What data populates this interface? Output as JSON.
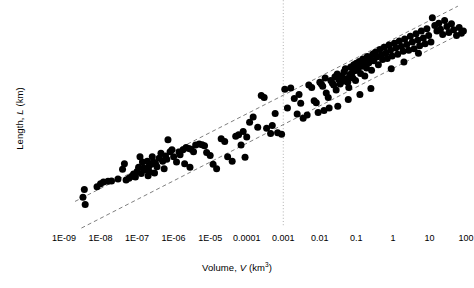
{
  "chart_data": {
    "type": "scatter",
    "title": "",
    "xlabel": "Volume, V (km3)",
    "ylabel": "Length, L (km)",
    "xscale": "log",
    "yscale": "log",
    "xlim": [
      1e-09,
      100
    ],
    "ylim": [
      0.001,
      100
    ],
    "grid": false,
    "legend": null,
    "xticks": [
      {
        "value": 1e-09,
        "label": "1E-09"
      },
      {
        "value": 1e-08,
        "label": "1E-08"
      },
      {
        "value": 1e-07,
        "label": "1E-07"
      },
      {
        "value": 1e-06,
        "label": "1E-06"
      },
      {
        "value": 1e-05,
        "label": "1E-05"
      },
      {
        "value": 0.0001,
        "label": "0.0001"
      },
      {
        "value": 0.001,
        "label": "0.001"
      },
      {
        "value": 0.01,
        "label": "0.01"
      },
      {
        "value": 0.1,
        "label": "0.1"
      },
      {
        "value": 1,
        "label": "1"
      },
      {
        "value": 10,
        "label": "10"
      },
      {
        "value": 100,
        "label": "100"
      }
    ],
    "yticks": [
      {
        "value": 100,
        "label": "100"
      },
      {
        "value": 10,
        "label": "10"
      },
      {
        "value": 1,
        "label": "1"
      },
      {
        "value": 0.1,
        "label": "0.1"
      },
      {
        "value": 0.01,
        "label": "0.01"
      },
      {
        "value": 0.001,
        "label": "0.001"
      }
    ],
    "annotations": [
      {
        "name": "upper-bound-line",
        "type": "dashed-line",
        "style": "dashed",
        "color": "#808080",
        "points": [
          [
            2e-09,
            0.0042
          ],
          [
            60,
            110
          ]
        ]
      },
      {
        "name": "lower-bound-line",
        "type": "dashed-line",
        "style": "dashed",
        "color": "#808080",
        "points": [
          [
            3e-09,
            0.00105
          ],
          [
            70,
            26
          ]
        ]
      },
      {
        "name": "volume-threshold-line",
        "type": "vertical-dotted-line",
        "style": "dotted",
        "color": "#b0b0b0",
        "x": 0.001,
        "ytop": 150,
        "ybottom": 0.00115
      }
    ],
    "marker": {
      "shape": "circle",
      "color": "#000000",
      "size_px": 7
    },
    "points": [
      [
        3.3e-09,
        0.0052
      ],
      [
        3.6e-09,
        0.0078
      ],
      [
        1.2e-08,
        0.0115
      ],
      [
        1.6e-08,
        0.012
      ],
      [
        2e-08,
        0.0122
      ],
      [
        3e-08,
        0.0135
      ],
      [
        4e-08,
        0.0225
      ],
      [
        4.5e-08,
        0.03
      ],
      [
        6e-08,
        0.014
      ],
      [
        7e-08,
        0.0155
      ],
      [
        8e-08,
        0.0175
      ],
      [
        9e-08,
        0.015
      ],
      [
        1e-07,
        0.02
      ],
      [
        1.1e-07,
        0.025
      ],
      [
        1.2e-07,
        0.043
      ],
      [
        1.4e-07,
        0.033
      ],
      [
        1.5e-07,
        0.024
      ],
      [
        1.7e-07,
        0.0215
      ],
      [
        2e-07,
        0.016
      ],
      [
        2.1e-07,
        0.026
      ],
      [
        2.4e-07,
        0.029
      ],
      [
        2.6e-07,
        0.043
      ],
      [
        2.8e-07,
        0.033
      ],
      [
        3e-07,
        0.0185
      ],
      [
        3.5e-07,
        0.0255
      ],
      [
        4e-07,
        0.04
      ],
      [
        4.5e-07,
        0.052
      ],
      [
        5e-07,
        0.034
      ],
      [
        5.5e-07,
        0.023
      ],
      [
        6e-07,
        0.045
      ],
      [
        7e-07,
        0.105
      ],
      [
        8e-07,
        0.056
      ],
      [
        9e-07,
        0.062
      ],
      [
        1e-06,
        0.043
      ],
      [
        1.2e-06,
        0.033
      ],
      [
        1.5e-06,
        0.048
      ],
      [
        1.8e-06,
        0.062
      ],
      [
        2.2e-06,
        0.07
      ],
      [
        2.6e-06,
        0.066
      ],
      [
        3e-06,
        0.064
      ],
      [
        3.5e-06,
        0.056
      ],
      [
        4e-06,
        0.079
      ],
      [
        5e-06,
        0.084
      ],
      [
        6e-06,
        0.081
      ],
      [
        7e-06,
        0.076
      ],
      [
        8e-06,
        0.054
      ],
      [
        1e-05,
        0.046
      ],
      [
        1.2e-05,
        0.029
      ],
      [
        1.5e-05,
        0.023
      ],
      [
        2e-05,
        0.11
      ],
      [
        2.5e-05,
        0.095
      ],
      [
        3e-05,
        0.043
      ],
      [
        4e-05,
        0.034
      ],
      [
        5e-05,
        0.125
      ],
      [
        6e-05,
        0.135
      ],
      [
        7e-05,
        0.08
      ],
      [
        9e-05,
        0.042
      ],
      [
        0.00012,
        0.26
      ],
      [
        0.00015,
        0.34
      ],
      [
        0.0002,
        0.2
      ],
      [
        0.00025,
        1.05
      ],
      [
        0.0003,
        0.95
      ],
      [
        0.00035,
        0.19
      ],
      [
        0.00045,
        0.145
      ],
      [
        0.0006,
        0.41
      ],
      [
        0.0007,
        0.15
      ],
      [
        0.0009,
        0.14
      ],
      [
        0.0011,
        1.45
      ],
      [
        0.0013,
        0.55
      ],
      [
        0.0016,
        1.55
      ],
      [
        0.002,
        0.9
      ],
      [
        0.0024,
        0.4
      ],
      [
        0.003,
        0.7
      ],
      [
        0.0035,
        0.32
      ],
      [
        0.0045,
        0.38
      ],
      [
        0.005,
        1.8
      ],
      [
        0.006,
        1.6
      ],
      [
        0.007,
        0.8
      ],
      [
        0.008,
        0.72
      ],
      [
        0.009,
        0.43
      ],
      [
        0.01,
        2.1
      ],
      [
        0.011,
        1.9
      ],
      [
        0.012,
        1.7
      ],
      [
        0.014,
        2.6
      ],
      [
        0.015,
        1.2
      ],
      [
        0.017,
        0.95
      ],
      [
        0.018,
        0.55
      ],
      [
        0.02,
        2.3
      ],
      [
        0.022,
        2.0
      ],
      [
        0.024,
        1.8
      ],
      [
        0.026,
        2.8
      ],
      [
        0.028,
        1.4
      ],
      [
        0.03,
        3.2
      ],
      [
        0.033,
        2.4
      ],
      [
        0.036,
        1.9
      ],
      [
        0.04,
        2.9
      ],
      [
        0.043,
        2.2
      ],
      [
        0.046,
        3.6
      ],
      [
        0.05,
        4.2
      ],
      [
        0.054,
        2.5
      ],
      [
        0.058,
        2.1
      ],
      [
        0.062,
        1.6
      ],
      [
        0.066,
        3.1
      ],
      [
        0.07,
        4.6
      ],
      [
        0.075,
        3.4
      ],
      [
        0.08,
        2.6
      ],
      [
        0.085,
        5.2
      ],
      [
        0.09,
        3.8
      ],
      [
        0.095,
        2.3
      ],
      [
        0.1,
        5.6
      ],
      [
        0.11,
        4.1
      ],
      [
        0.12,
        6.2
      ],
      [
        0.13,
        3.3
      ],
      [
        0.14,
        4.8
      ],
      [
        0.15,
        7.0
      ],
      [
        0.16,
        5.4
      ],
      [
        0.17,
        2.9
      ],
      [
        0.18,
        6.6
      ],
      [
        0.19,
        4.4
      ],
      [
        0.2,
        8.0
      ],
      [
        0.22,
        5.8
      ],
      [
        0.24,
        7.4
      ],
      [
        0.26,
        3.9
      ],
      [
        0.28,
        9.0
      ],
      [
        0.3,
        6.4
      ],
      [
        0.33,
        10.0
      ],
      [
        0.36,
        7.8
      ],
      [
        0.4,
        5.2
      ],
      [
        0.44,
        11.5
      ],
      [
        0.48,
        8.6
      ],
      [
        0.52,
        6.8
      ],
      [
        0.58,
        13.0
      ],
      [
        0.64,
        9.5
      ],
      [
        0.7,
        7.2
      ],
      [
        0.78,
        14.5
      ],
      [
        0.86,
        11.0
      ],
      [
        0.95,
        8.2
      ],
      [
        1.1,
        16.0
      ],
      [
        1.2,
        12.5
      ],
      [
        1.35,
        9.0
      ],
      [
        1.5,
        18.0
      ],
      [
        1.7,
        13.5
      ],
      [
        1.9,
        10.5
      ],
      [
        2.1,
        20.0
      ],
      [
        2.4,
        15.0
      ],
      [
        2.7,
        11.0
      ],
      [
        3.0,
        23.0
      ],
      [
        3.4,
        17.0
      ],
      [
        3.8,
        12.0
      ],
      [
        4.3,
        26.0
      ],
      [
        4.8,
        19.0
      ],
      [
        5.4,
        14.0
      ],
      [
        6.0,
        30.0
      ],
      [
        6.8,
        21.0
      ],
      [
        7.6,
        15.5
      ],
      [
        8.5,
        34.0
      ],
      [
        9.5,
        24.0
      ],
      [
        11.0,
        17.0
      ],
      [
        12.0,
        60.0
      ],
      [
        14.0,
        40.0
      ],
      [
        16.0,
        30.0
      ],
      [
        18.0,
        45.0
      ],
      [
        20.0,
        33.0
      ],
      [
        23.0,
        25.0
      ],
      [
        26.0,
        52.0
      ],
      [
        30.0,
        38.0
      ],
      [
        34.0,
        28.0
      ],
      [
        40.0,
        44.0
      ],
      [
        46.0,
        32.0
      ],
      [
        55.0,
        24.0
      ],
      [
        65.0,
        36.0
      ],
      [
        75.0,
        27.0
      ],
      [
        85.0,
        30.0
      ],
      [
        3.8e-09,
        0.0036
      ],
      [
        8e-09,
        0.009
      ],
      [
        1e-08,
        0.0105
      ],
      [
        5e-08,
        0.0128
      ],
      [
        1.3e-07,
        0.018
      ],
      [
        1.9e-07,
        0.034
      ],
      [
        2.2e-07,
        0.0195
      ],
      [
        3.2e-07,
        0.03
      ],
      [
        6.5e-07,
        0.038
      ],
      [
        1.4e-06,
        0.055
      ],
      [
        2e-06,
        0.03
      ],
      [
        2.8e-06,
        0.025
      ],
      [
        8e-05,
        0.16
      ],
      [
        0.0001,
        0.12
      ],
      [
        0.0005,
        0.22
      ],
      [
        0.0027,
        1.1
      ],
      [
        0.013,
        0.48
      ],
      [
        0.031,
        0.6
      ],
      [
        0.06,
        0.85
      ],
      [
        0.125,
        1.1
      ],
      [
        0.25,
        1.5
      ],
      [
        0.9,
        4.2
      ],
      [
        2.0,
        6.0
      ],
      [
        5.0,
        9.5
      ]
    ]
  }
}
